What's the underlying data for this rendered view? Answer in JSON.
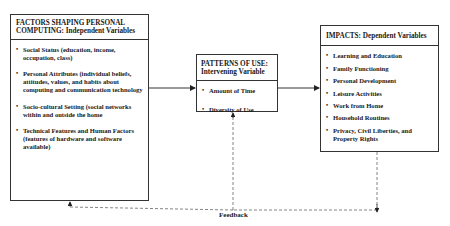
{
  "diagram": {
    "independent": {
      "title": "FACTORS SHAPING PERSONAL COMPUTING: Independent Variables",
      "items": [
        "Social Status (education, income, occupation, class)",
        "Personal Attributes (individual beliefs, attitudes, values, and habits about computing and communication technology",
        "Socio-cultural Setting (social networks within and outside the home",
        "Technical Features and Human Factors (features of hardware and software available)"
      ]
    },
    "intervening": {
      "title": "PATTERNS OF USE: Intervening Variable",
      "items": [
        "Amount of Time",
        "Diversity of Use"
      ]
    },
    "dependent": {
      "title": "IMPACTS: Dependent Variables",
      "items": [
        "Learning and Education",
        "Family Functioning",
        "Personal Development",
        "Leisure Activities",
        "Work from Home",
        "Household Routines",
        "Privacy, Civil Liberties, and Property Rights"
      ]
    },
    "feedback_label": "Feedback",
    "colors": {
      "line": "#333333",
      "dashed": "#666666",
      "background": "#ffffff"
    }
  }
}
